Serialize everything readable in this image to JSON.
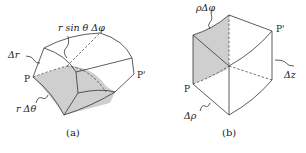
{
  "figure_a": {
    "caption": "(a)",
    "labels": {
      "r_sin_theta_dphi": "r sin θ Δφ",
      "delta_r": "Δr",
      "r_delta_theta": "r Δθ",
      "point_p": "P",
      "point_p_prime": "P'"
    }
  },
  "figure_b": {
    "caption": "(b)",
    "labels": {
      "rho_delta_phi": "ρΔφ",
      "delta_z": "Δz",
      "delta_rho": "Δρ",
      "point_p": "P",
      "point_p_prime": "P'"
    }
  },
  "colors": {
    "stroke": "#333333",
    "shade": "#cfcfcf",
    "background": "#ffffff"
  }
}
